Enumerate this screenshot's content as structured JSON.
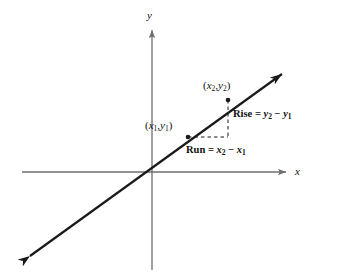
{
  "figure": {
    "type": "slope-diagram",
    "background_color": "#ffffff",
    "ink_color": "#1a1a1a",
    "axis_color": "#6e6e6e"
  },
  "axes": {
    "x_label": "x",
    "y_label": "y",
    "origin": {
      "x": 152,
      "y": 172
    },
    "x_axis": {
      "x1": 22,
      "y1": 172,
      "x2": 288,
      "y2": 172,
      "arrow": "right"
    },
    "y_axis": {
      "x1": 152,
      "y1": 270,
      "x2": 152,
      "y2": 28,
      "arrow": "up"
    }
  },
  "line": {
    "name": "slope-line",
    "from": {
      "x": 22,
      "y": 262
    },
    "to": {
      "x": 288,
      "y": 70
    },
    "arrows": "both"
  },
  "points": [
    {
      "id": "p1",
      "label": "(x1, y1)",
      "x": 188,
      "y": 137
    },
    {
      "id": "p2",
      "label": "(x2, y2)",
      "x": 228,
      "y": 100
    }
  ],
  "triangle": {
    "rise_leg": {
      "x": 228,
      "y1": 100,
      "y2": 137
    },
    "run_leg": {
      "y": 137,
      "x1": 188,
      "x2": 228
    },
    "style": "dashed"
  },
  "annotations": {
    "point1": {
      "open": "(",
      "x": "x",
      "sub1": "1",
      "comma": ",",
      "y": "y",
      "sub2": "1",
      "close": ")"
    },
    "point2": {
      "open": "(",
      "x": "x",
      "sub1": "2",
      "comma": ",",
      "y": "y",
      "sub2": "2",
      "close": ")"
    },
    "rise": {
      "word": "Rise",
      "eq": "=",
      "term1": "y",
      "sub1": "2",
      "minus": "−",
      "term2": "y",
      "sub2": "1"
    },
    "run": {
      "word": "Run",
      "eq": "=",
      "term1": "x",
      "sub1": "2",
      "minus": "−",
      "term2": "x",
      "sub2": "1"
    }
  }
}
